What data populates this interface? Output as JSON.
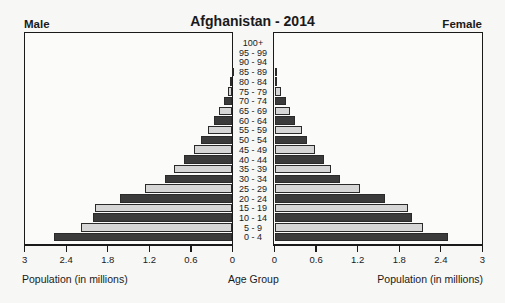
{
  "chart_data": {
    "type": "bar",
    "subtype": "population-pyramid",
    "title": "Afghanistan - 2014",
    "left_label": "Male",
    "right_label": "Female",
    "xlabel_left": "Population (in millions)",
    "xlabel_center": "Age Group",
    "xlabel_right": "Population (in millions)",
    "xlim": [
      0,
      3
    ],
    "ticks": [
      "0",
      "0.6",
      "1.2",
      "1.8",
      "2.4",
      "3"
    ],
    "categories": [
      "100+",
      "95 - 99",
      "90 - 94",
      "85 - 89",
      "80 - 84",
      "75 - 79",
      "70 - 74",
      "65 - 69",
      "60 - 64",
      "55 - 59",
      "50 - 54",
      "45 - 49",
      "40 - 44",
      "35 - 39",
      "30 - 34",
      "25 - 29",
      "20 - 24",
      "15 - 19",
      "10 - 14",
      "5 - 9",
      "0 - 4"
    ],
    "series": [
      {
        "name": "Male",
        "values": [
          0.0,
          0.0,
          0.0,
          0.01,
          0.03,
          0.07,
          0.12,
          0.19,
          0.26,
          0.36,
          0.45,
          0.56,
          0.7,
          0.85,
          0.97,
          1.26,
          1.63,
          1.99,
          2.02,
          2.18,
          2.57
        ]
      },
      {
        "name": "Female",
        "values": [
          0.0,
          0.0,
          0.0,
          0.01,
          0.04,
          0.1,
          0.16,
          0.22,
          0.29,
          0.39,
          0.47,
          0.58,
          0.71,
          0.82,
          0.95,
          1.23,
          1.59,
          1.93,
          1.99,
          2.14,
          2.51
        ]
      }
    ],
    "colors": {
      "dark": "#3b3b3b",
      "light": "#d6d6d6"
    },
    "grid": false,
    "legend": "none"
  }
}
